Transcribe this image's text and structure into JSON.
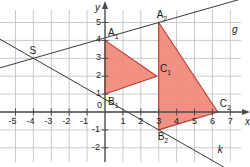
{
  "figure": {
    "kind": "coordinate-plane-geometry",
    "background": "#ffffff",
    "grid_color": "#b9bfc6",
    "axis_color": "#4a4a4a",
    "line_color": "#3a3a3a",
    "triangle_fill": "#ef8878",
    "triangle_stroke": "#c0392b"
  },
  "axes": {
    "x_label": "x",
    "y_label": "y",
    "x_min": -6,
    "x_max": 7.6,
    "y_min": -2.8,
    "y_max": 5.7,
    "origin_label": "0",
    "x_ticks": [
      {
        "value": -5,
        "label": "-5"
      },
      {
        "value": -4,
        "label": "-4"
      },
      {
        "value": -3,
        "label": "-3"
      },
      {
        "value": -2,
        "label": "-2"
      },
      {
        "value": -1,
        "label": "-1"
      },
      {
        "value": 1,
        "label": "1"
      },
      {
        "value": 2,
        "label": "2"
      },
      {
        "value": 3,
        "label": "3"
      },
      {
        "value": 4,
        "label": "4"
      },
      {
        "value": 5,
        "label": "5"
      },
      {
        "value": 6,
        "label": "6"
      },
      {
        "value": 7,
        "label": "7"
      }
    ],
    "y_ticks": [
      {
        "value": 5,
        "label": "5"
      },
      {
        "value": 4,
        "label": "4"
      },
      {
        "value": 3,
        "label": "3"
      },
      {
        "value": 2,
        "label": "2"
      },
      {
        "value": 1,
        "label": "1"
      },
      {
        "value": -1,
        "label": "-1"
      },
      {
        "value": -2,
        "label": "-2"
      }
    ]
  },
  "chart_data": {
    "type": "scatter",
    "title": "",
    "xlabel": "x",
    "ylabel": "y",
    "xlim": [
      -6,
      7.6
    ],
    "ylim": [
      -2.8,
      5.7
    ],
    "grid": true,
    "grid_step": 1,
    "shapes": [
      {
        "name": "triangle-1",
        "label": "A1 B1 C1",
        "vertices": [
          {
            "label": "A",
            "sub": "1",
            "x": 0,
            "y": 4
          },
          {
            "label": "B",
            "sub": "1",
            "x": 0,
            "y": 1
          },
          {
            "label": "C",
            "sub": "1",
            "x": 2.9,
            "y": 2
          }
        ]
      },
      {
        "name": "triangle-2",
        "label": "A2 B2 C2",
        "vertices": [
          {
            "label": "A",
            "sub": "2",
            "x": 3,
            "y": 5
          },
          {
            "label": "B",
            "sub": "2",
            "x": 3,
            "y": -1
          },
          {
            "label": "C",
            "sub": "2",
            "x": 6.3,
            "y": 0
          }
        ]
      }
    ],
    "points": [
      {
        "label": "S",
        "sub": "",
        "x": -4,
        "y": 3
      }
    ],
    "lines": [
      {
        "name": "g",
        "label": "g",
        "through": [
          [
            -4,
            3
          ],
          [
            3,
            5
          ]
        ],
        "x_from": -6.3,
        "x_to": 7.6
      },
      {
        "name": "k",
        "label": "k",
        "through": [
          [
            -4,
            3
          ],
          [
            3,
            -1
          ]
        ],
        "x_from": -6.3,
        "x_to": 7.6
      }
    ]
  },
  "labels": {
    "A1": "A",
    "A1_sub": "1",
    "B1": "B",
    "B1_sub": "1",
    "C1": "C",
    "C1_sub": "1",
    "A2": "A",
    "A2_sub": "2",
    "B2": "B",
    "B2_sub": "2",
    "C2": "C",
    "C2_sub": "2",
    "S": "S",
    "g": "g",
    "k": "k",
    "x_axis": "x",
    "y_axis": "y",
    "origin": "0"
  }
}
